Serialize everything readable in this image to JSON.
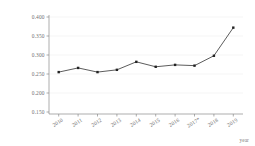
{
  "chart_data": {
    "type": "line",
    "title": "",
    "subtitle": "",
    "xlabel": "year",
    "ylabel": "overall differences",
    "categories": [
      "2010",
      "2011",
      "2012",
      "2013",
      "2014",
      "2015",
      "2016",
      "2017*",
      "2018",
      "2019"
    ],
    "x": [
      2010,
      2011,
      2012,
      2013,
      2014,
      2015,
      2016,
      2017,
      2018,
      2019
    ],
    "values": [
      0.255,
      0.266,
      0.255,
      0.261,
      0.282,
      0.269,
      0.274,
      0.272,
      0.298,
      0.372
    ],
    "series": [
      {
        "name": "overall differences",
        "values": [
          0.255,
          0.266,
          0.255,
          0.261,
          0.282,
          0.269,
          0.274,
          0.272,
          0.298,
          0.372
        ]
      }
    ],
    "ylim": [
      0.15,
      0.4
    ],
    "xlim": [
      2010,
      2019
    ],
    "ytick_labels": [
      "0.400",
      "0.350",
      "0.300",
      "0.250",
      "0.200",
      "0.150"
    ],
    "ytick_values": [
      0.4,
      0.35,
      0.3,
      0.25,
      0.2,
      0.15
    ],
    "grid": true,
    "grid_axis": "y",
    "legend": false,
    "legend_position": "none",
    "marker": "square",
    "line_color": "#4a4a4a",
    "marker_color": "#222222",
    "background_color": "#ffffff",
    "axis_color": "#8a8a8a",
    "grid_color": "#e8e8e8",
    "annotations": []
  }
}
